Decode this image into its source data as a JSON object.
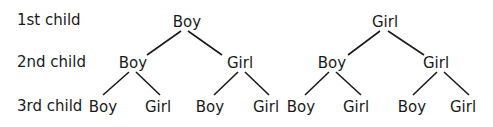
{
  "row_labels": [
    "1st child",
    "2nd child",
    "3rd child"
  ],
  "trees": [
    {
      "root": "Boy",
      "level2": [
        "Boy",
        "Girl"
      ],
      "level3": [
        "Boy",
        "Girl",
        "Boy",
        "Girl"
      ]
    },
    {
      "root": "Girl",
      "level2": [
        "Boy",
        "Girl"
      ],
      "level3": [
        "Boy",
        "Girl",
        "Boy",
        "Girl"
      ]
    }
  ],
  "colors": {
    "text": "#1a1a1a",
    "line": "#1a1a1a",
    "background": "#ffffff"
  }
}
